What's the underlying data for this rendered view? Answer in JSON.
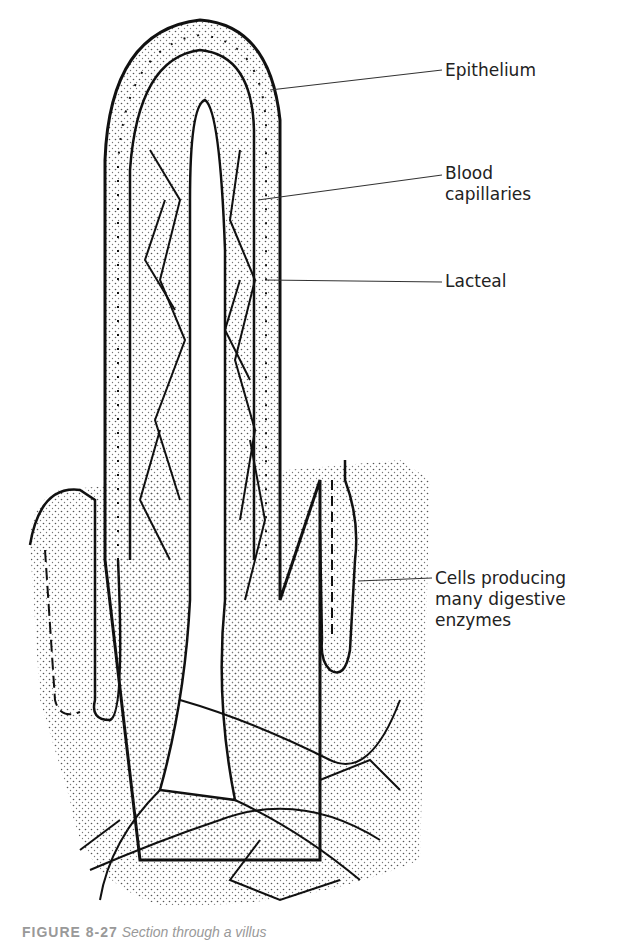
{
  "figure": {
    "title": "Section through a villus",
    "caption_number": "FIGURE 8-27",
    "caption_text": "Section through a villus",
    "labels": [
      {
        "id": "epithelium",
        "text": "Epithelium"
      },
      {
        "id": "blood-capillaries",
        "line1": "Blood",
        "line2": "capillaries"
      },
      {
        "id": "lacteal",
        "text": "Lacteal"
      },
      {
        "id": "digestive-cells",
        "line1": "Cells producing",
        "line2": "many digestive",
        "line3": "enzymes"
      }
    ]
  }
}
